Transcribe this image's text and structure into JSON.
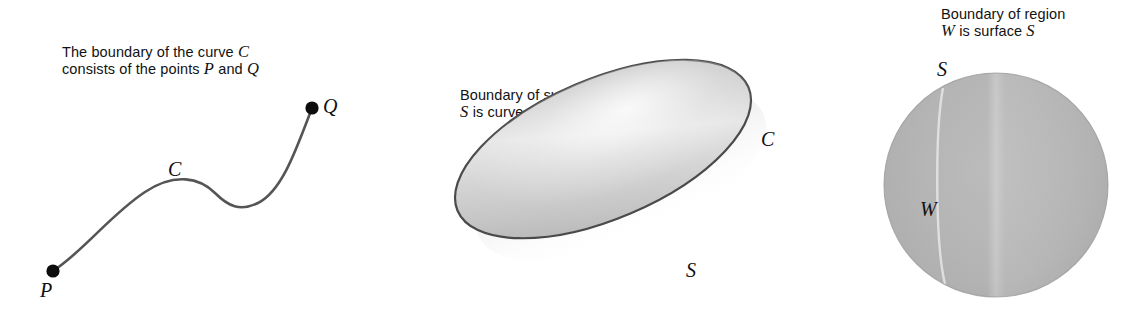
{
  "panels": [
    {
      "id": "curve",
      "caption_line1_pre": "The boundary of the curve ",
      "caption_line1_var": "C",
      "caption_line2_pre": "consists of the points ",
      "caption_line2_var1": "P",
      "caption_line2_mid": " and ",
      "caption_line2_var2": "Q",
      "labels": {
        "curve": "C",
        "start_point": "P",
        "end_point": "Q"
      }
    },
    {
      "id": "surface",
      "caption_line1": "Boundary of surface",
      "caption_line2_var1": "S",
      "caption_line2_mid": " is curve ",
      "caption_line2_var2": "C",
      "labels": {
        "boundary_curve": "C",
        "surface": "S"
      }
    },
    {
      "id": "region",
      "caption_line1": "Boundary of region",
      "caption_line2_var1": "W",
      "caption_line2_mid": " is surface ",
      "caption_line2_var2": "S",
      "labels": {
        "surface": "S",
        "region": "W"
      }
    }
  ],
  "colors": {
    "background": "#ffffff",
    "ink": "#121212",
    "curve_stroke": "#555555",
    "outline_stroke": "#4a4a4a",
    "shade_light": "#f2f2f2",
    "shade_mid": "#c9c9c9",
    "shade_dark": "#9a9a9a",
    "sphere_light": "#c8c8c8",
    "sphere_mid": "#b3b3b3",
    "sphere_dark": "#9c9c9c"
  }
}
